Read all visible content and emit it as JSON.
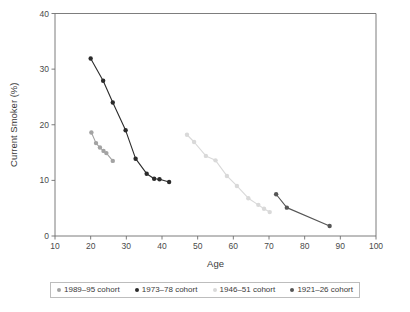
{
  "chart_data": {
    "type": "line",
    "title": "",
    "xlabel": "Age",
    "ylabel": "Current Smoker (%)",
    "xlim": [
      10,
      100
    ],
    "ylim": [
      0,
      40
    ],
    "xticks": [
      10,
      20,
      30,
      40,
      50,
      60,
      70,
      80,
      90,
      100
    ],
    "yticks": [
      0,
      10,
      20,
      30,
      40
    ],
    "xtick_labels": [
      "10",
      "20",
      "30",
      "40",
      "50",
      "60",
      "70",
      "80",
      "90",
      "100"
    ],
    "ytick_labels": [
      "0",
      "10",
      "20",
      "30",
      "40"
    ],
    "grid": false,
    "legend_position": "below-center",
    "series": [
      {
        "name": "1989–95 cohort",
        "color": "#a3a3a3",
        "x": [
          20.2,
          21.5,
          22.6,
          23.6,
          24.4,
          26.2
        ],
        "y": [
          18.6,
          16.7,
          15.9,
          15.3,
          14.9,
          13.5
        ]
      },
      {
        "name": "1973–78 cohort",
        "color": "#2b2b2b",
        "x": [
          20.0,
          23.5,
          26.2,
          29.8,
          32.6,
          35.7,
          37.8,
          39.3,
          42.0
        ],
        "y": [
          31.9,
          27.9,
          24.0,
          19.0,
          13.9,
          11.2,
          10.3,
          10.2,
          9.7
        ]
      },
      {
        "name": "1946–51 cohort",
        "color": "#d9d9d9",
        "x": [
          47.0,
          49.0,
          52.3,
          55.0,
          58.2,
          61.0,
          64.2,
          67.0,
          68.6,
          70.2
        ],
        "y": [
          18.2,
          16.9,
          14.4,
          13.6,
          10.8,
          9.0,
          6.8,
          5.6,
          4.9,
          4.3
        ]
      },
      {
        "name": "1921–26 cohort",
        "color": "#565656",
        "x": [
          72.0,
          75.0,
          87.0
        ],
        "y": [
          7.5,
          5.1,
          1.8
        ]
      }
    ]
  },
  "legend": {
    "items": [
      {
        "label": "1989–95 cohort",
        "color": "#a3a3a3"
      },
      {
        "label": "1973–78 cohort",
        "color": "#2b2b2b"
      },
      {
        "label": "1946–51 cohort",
        "color": "#d9d9d9"
      },
      {
        "label": "1921–26 cohort",
        "color": "#565656"
      }
    ]
  }
}
